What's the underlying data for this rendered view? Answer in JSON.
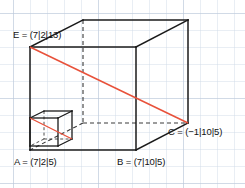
{
  "figure": {
    "background_color": "#ffffff",
    "grid": {
      "spacing_px": 17,
      "color": "#c9d4e2",
      "major_color": "#b3c1d4",
      "offset_x": 13,
      "offset_y": 13,
      "visible": true
    },
    "colors": {
      "edge": "#1a1a1a",
      "hidden_edge": "#333333",
      "diagonal": "#e8513a",
      "label_text": "#111111"
    },
    "shapes": {
      "cuboid": {
        "name": "large-cuboid",
        "front_face": {
          "top_left": [
            30,
            47
          ],
          "top_right": [
            136,
            47
          ],
          "bottom_right": [
            136,
            150
          ],
          "bottom_left": [
            30,
            150
          ]
        },
        "back_offset": [
          52,
          -27
        ],
        "back_face": {
          "top_left": [
            83,
            20
          ],
          "top_right": [
            188,
            20
          ],
          "bottom_right": [
            188,
            123
          ],
          "bottom_left": [
            83,
            123
          ]
        },
        "hidden_edges": [
          [
            [
              83,
              20
            ],
            [
              83,
              123
            ]
          ],
          [
            [
              83,
              123
            ],
            [
              188,
              123
            ]
          ],
          [
            [
              83,
              123
            ],
            [
              30,
              150
            ]
          ]
        ]
      },
      "unit_cube": {
        "name": "small-unit-cube",
        "front_face": {
          "top_left": [
            30,
            118
          ],
          "top_right": [
            58,
            118
          ],
          "bottom_right": [
            58,
            146
          ],
          "bottom_left": [
            30,
            146
          ]
        },
        "back_offset": [
          14,
          -7
        ],
        "hidden_edges": [
          [
            [
              44,
              111
            ],
            [
              44,
              139
            ]
          ],
          [
            [
              44,
              139
            ],
            [
              72,
              139
            ]
          ],
          [
            [
              44,
              139
            ],
            [
              30,
              146
            ]
          ]
        ]
      },
      "diagonals": [
        {
          "name": "space-diagonal-EC",
          "from": [
            30,
            47
          ],
          "to": [
            188,
            123
          ],
          "color": "#e8513a"
        },
        {
          "name": "unit-cube-diagonal",
          "from": [
            30,
            118
          ],
          "to": [
            72,
            139
          ],
          "color": "#e8513a"
        }
      ]
    }
  },
  "labels": {
    "E": {
      "text": "E = (7|2|13)",
      "point_name": "E",
      "coordinates": [
        7,
        2,
        13
      ],
      "x": 13,
      "y": 30
    },
    "A": {
      "text": "A = (7|2|5)",
      "point_name": "A",
      "coordinates": [
        7,
        2,
        5
      ],
      "x": 14,
      "y": 157
    },
    "B": {
      "text": "B = (7|10|5)",
      "point_name": "B",
      "coordinates": [
        7,
        10,
        5
      ],
      "x": 117,
      "y": 157
    },
    "C": {
      "text": "C = (−1|10|5)",
      "point_name": "C",
      "coordinates": [
        -1,
        10,
        5
      ],
      "x": 168,
      "y": 127
    }
  }
}
